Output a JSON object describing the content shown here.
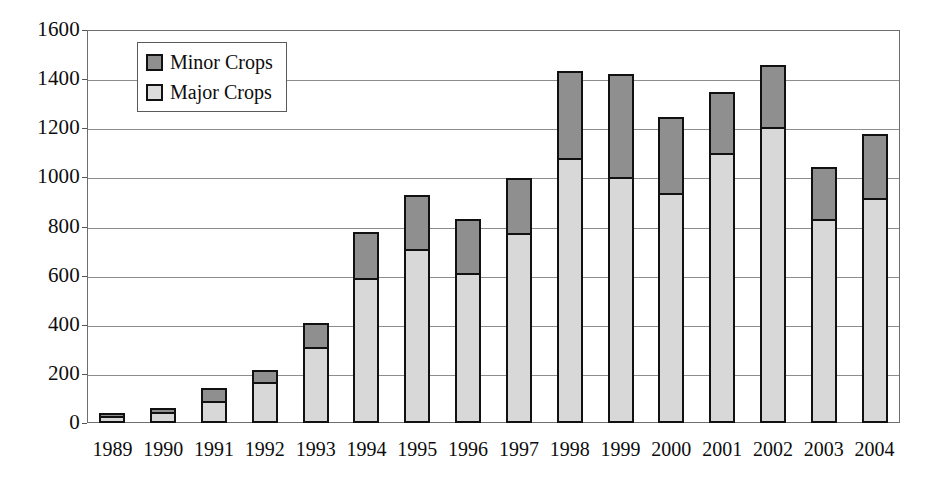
{
  "chart_data": {
    "type": "bar",
    "subtype": "stacked-vertical",
    "title": "",
    "xlabel": "",
    "ylabel": "",
    "ylim": [
      0,
      1600
    ],
    "ytick_step": 200,
    "ytick_labels": [
      "1600",
      "1400",
      "1200",
      "1000",
      "800",
      "600",
      "400",
      "200",
      "0"
    ],
    "ytick_values": [
      1600,
      1400,
      1200,
      1000,
      800,
      600,
      400,
      200,
      0
    ],
    "grid": true,
    "grid_axis": "y",
    "legend_position": "upper-left-inside",
    "categories": [
      "1989",
      "1990",
      "1991",
      "1992",
      "1993",
      "1994",
      "1995",
      "1996",
      "1997",
      "1998",
      "1999",
      "2000",
      "2001",
      "2002",
      "2003",
      "2004"
    ],
    "series": [
      {
        "name": "Major Crops",
        "color": "#d8d8d8",
        "values": [
          30,
          45,
          90,
          165,
          310,
          590,
          710,
          610,
          775,
          1080,
          1000,
          935,
          1100,
          1205,
          830,
          915
        ]
      },
      {
        "name": "Minor Crops",
        "color": "#8f8f8f",
        "values": [
          20,
          25,
          60,
          60,
          105,
          195,
          225,
          230,
          230,
          360,
          430,
          320,
          255,
          260,
          220,
          270
        ]
      }
    ],
    "totals": [
      50,
      70,
      150,
      225,
      415,
      785,
      935,
      840,
      1005,
      1440,
      1430,
      1255,
      1355,
      1465,
      1050,
      1185
    ]
  },
  "legend": {
    "items": [
      {
        "label": "Minor Crops",
        "swatch": "minor-crops-swatch"
      },
      {
        "label": "Major Crops",
        "swatch": "major-crops-swatch"
      }
    ]
  }
}
